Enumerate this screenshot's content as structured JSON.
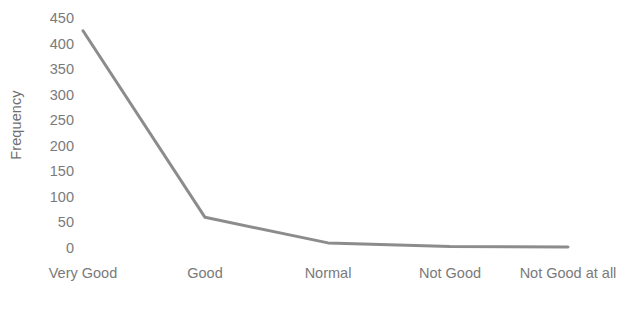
{
  "chart_data": {
    "type": "line",
    "title": "",
    "xlabel": "",
    "ylabel": "Frequency",
    "categories": [
      "Very Good",
      "Good",
      "Normal",
      "Not Good",
      "Not Good at all"
    ],
    "values": [
      425,
      60,
      10,
      3,
      2
    ],
    "series": [
      {
        "name": "Frequency",
        "values": [
          425,
          60,
          10,
          3,
          2
        ],
        "color": "#8c8c8c"
      }
    ],
    "ylim": [
      0,
      450
    ],
    "ytick_labels": [
      "0",
      "50",
      "100",
      "150",
      "200",
      "250",
      "300",
      "350",
      "400",
      "450"
    ],
    "ytick_values": [
      0,
      50,
      100,
      150,
      200,
      250,
      300,
      350,
      400,
      450
    ],
    "grid": false,
    "legend": false,
    "legend_position": "none",
    "axis_lines": false,
    "markers": false,
    "line_width": 3,
    "line_color": "#8c8c8c",
    "text_color": "#7a7a7a",
    "background_color": "#ffffff"
  }
}
